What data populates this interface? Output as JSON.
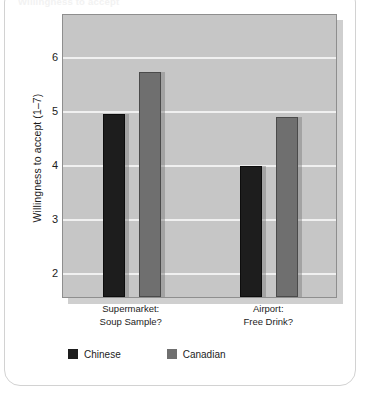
{
  "figure": {
    "clipped_caption": "Willingness to accept",
    "card_border_color": "#d2d2d2",
    "background_color": "#ffffff"
  },
  "chart_data": {
    "type": "bar",
    "title": "",
    "subtitle": "",
    "xlabel": "",
    "ylabel": "Willingness to accept (1–7)",
    "categories": [
      "Supermarket:\nSoup Sample?",
      "Airport:\nFree Drink?"
    ],
    "category_lines": [
      [
        "Supermarket:",
        "Soup Sample?"
      ],
      [
        "Airport:",
        "Free Drink?"
      ]
    ],
    "series": [
      {
        "name": "Chinese",
        "color": "#1d1d1d",
        "values": [
          4.93,
          3.96
        ]
      },
      {
        "name": "Canadian",
        "color": "#6f6f6f",
        "values": [
          5.7,
          4.88
        ]
      }
    ],
    "ylim": [
      1.54,
      6.8
    ],
    "yticks": [
      2,
      3,
      4,
      5,
      6
    ],
    "ytick_labels": [
      "2",
      "3",
      "4",
      "5",
      "6"
    ],
    "grid": true,
    "grid_color": "#f0f0f0",
    "legend_position": "bottom-left",
    "plot_background": "#c6c6c6",
    "plot_border_color": "#8e8e8e"
  },
  "legend": {
    "items": [
      {
        "label": "Chinese",
        "color": "#1d1d1d"
      },
      {
        "label": "Canadian",
        "color": "#6f6f6f"
      }
    ]
  }
}
